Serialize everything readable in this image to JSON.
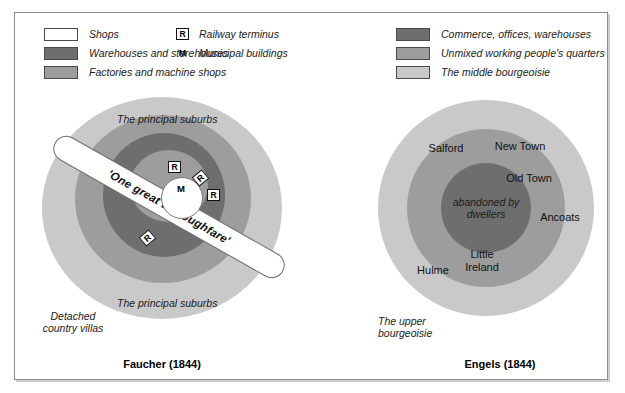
{
  "legend_left": {
    "items": [
      {
        "label": "Shops",
        "color": "#ffffff"
      },
      {
        "label": "Warehouses and storehouses",
        "color": "#6e6e6e"
      },
      {
        "label": "Factories and machine shops",
        "color": "#9d9d9d"
      }
    ]
  },
  "legend_markers": {
    "items": [
      {
        "symbol": "R",
        "label": "Railway terminus",
        "boxed": true
      },
      {
        "symbol": "M",
        "label": "Municipal buildings",
        "boxed": false
      }
    ]
  },
  "legend_right": {
    "items": [
      {
        "label": "Commerce, offices, warehouses",
        "color": "#6e6e6e"
      },
      {
        "label": "Unmixed working people's quarters",
        "color": "#9d9d9d"
      },
      {
        "label": "The middle bourgeoisie",
        "color": "#c9c9c9"
      }
    ]
  },
  "faucher": {
    "caption": "Faucher (1844)",
    "rings": [
      {
        "name": "principal-suburbs-outer",
        "color": "#c9c9c9"
      },
      {
        "name": "factories-machine-shops",
        "color": "#9d9d9d"
      },
      {
        "name": "warehouses-storehouses",
        "color": "#6e6e6e"
      },
      {
        "name": "inner-factories",
        "color": "#9d9d9d"
      }
    ],
    "labels": {
      "suburbs_top": "The principal suburbs",
      "suburbs_bottom": "The principal suburbs",
      "villas": "Detached\ncountry villas",
      "villas_line1": "Detached",
      "villas_line2": "country villas",
      "thoroughfare": "'One great thoroughfare'",
      "centre_marker": "M"
    },
    "railway_termini": [
      {
        "symbol": "R",
        "x": 168,
        "y": 161,
        "rotation": 0
      },
      {
        "symbol": "R",
        "x": 194,
        "y": 172,
        "rotation": -40
      },
      {
        "symbol": "R",
        "x": 207,
        "y": 189,
        "rotation": 0
      },
      {
        "symbol": "R",
        "x": 141,
        "y": 232,
        "rotation": -40
      }
    ]
  },
  "engels": {
    "caption": "Engels (1844)",
    "rings": [
      {
        "name": "middle-bourgeoisie",
        "color": "#c9c9c9"
      },
      {
        "name": "working-peoples-quarters",
        "color": "#9d9d9d"
      },
      {
        "name": "commerce-offices-warehouses",
        "color": "#6e6e6e"
      }
    ],
    "core_label_line1": "abandoned by",
    "core_label_line2": "dwellers",
    "upper_bourgeoisie_line1": "The upper",
    "upper_bourgeoisie_line2": "bourgeoisie",
    "places": [
      {
        "name": "Salford",
        "x": 440,
        "y": 146
      },
      {
        "name": "New Town",
        "x": 495,
        "y": 143
      },
      {
        "name": "Old Town",
        "x": 511,
        "y": 178
      },
      {
        "name": "Ancoats",
        "x": 553,
        "y": 215
      },
      {
        "name": "Little\nIreland",
        "line1": "Little",
        "line2": "Ireland",
        "x": 477,
        "y": 252
      },
      {
        "name": "Hulme",
        "x": 431,
        "y": 268
      }
    ]
  },
  "colors": {
    "dark": "#6e6e6e",
    "medium": "#9d9d9d",
    "light": "#c9c9c9",
    "white": "#ffffff",
    "frame": "#8d8d8d",
    "text": "#1a1a1a"
  }
}
